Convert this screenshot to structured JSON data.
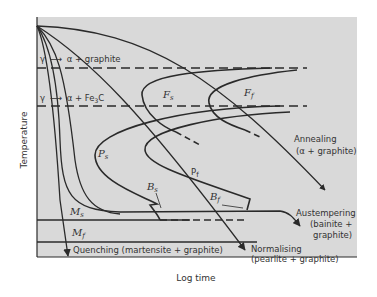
{
  "diagram": {
    "axes": {
      "x_label": "Log time",
      "y_label": "Temperature"
    },
    "reaction_lines": [
      {
        "label_left": "γ",
        "label_right": "α + graphite"
      },
      {
        "label_left": "γ",
        "label_right": "α  + Fe",
        "sub": "3",
        "tail": "C"
      }
    ],
    "curve_labels": {
      "fs": "F",
      "fs_sub": "s",
      "ff": "F",
      "ff_sub": "f",
      "ps": "P",
      "ps_sub": "s",
      "pf": "P",
      "pf_sub": "f",
      "bs": "B",
      "bs_sub": "s",
      "bf": "B",
      "bf_sub": "f",
      "ms": "M",
      "ms_sub": "s",
      "mf": "M",
      "mf_sub": "f"
    },
    "treatments": {
      "annealing": {
        "line1": "Annealing",
        "line2": "(α + graphite)"
      },
      "austempering": {
        "line1": "Austempering",
        "line2": "(bainite +",
        "line3": "graphite)"
      },
      "normalising": {
        "line1": "Normalising",
        "line2": "(pearlite + graphite)"
      },
      "quenching": {
        "line1": "Quenching (martensite + graphite)"
      }
    },
    "colors": {
      "plot_bg": "#d9d9d9",
      "line": "#2a2a2a",
      "text": "#333333"
    }
  }
}
